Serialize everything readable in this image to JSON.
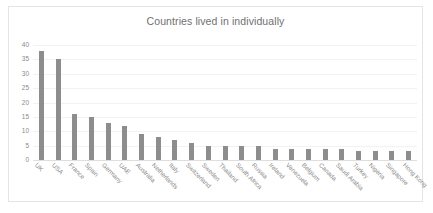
{
  "chart": {
    "title": "Countries lived in individually"
  },
  "chart_data": {
    "type": "bar",
    "title": "Countries lived in individually",
    "xlabel": "",
    "ylabel": "",
    "ylim": [
      0,
      40
    ],
    "yticks": [
      0,
      5,
      10,
      15,
      20,
      25,
      30,
      35,
      40
    ],
    "grid": true,
    "legend": false,
    "bar_color": "#8d8d8d",
    "categories": [
      "UK",
      "USA",
      "France",
      "Spain",
      "Germany",
      "UAE",
      "Australia",
      "Netherlands",
      "Italy",
      "Switzerland",
      "Sweden",
      "Thailand",
      "South Africa",
      "Russia",
      "Ireland",
      "Venezuela",
      "Belgium",
      "Canada",
      "Saudi Arabia",
      "Turkey",
      "Nigeria",
      "Singapore",
      "Hong Kong"
    ],
    "values": [
      38,
      35,
      16,
      15,
      13,
      12,
      9,
      8,
      7,
      6,
      5,
      5,
      5,
      5,
      4,
      4,
      4,
      4,
      4,
      3,
      3,
      3,
      3
    ]
  }
}
